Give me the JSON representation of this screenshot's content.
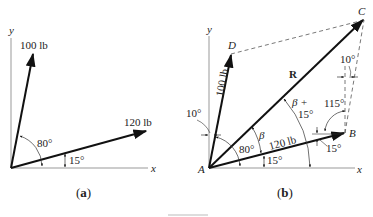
{
  "figure_a": {
    "caption": "(a)",
    "axis_x": "x",
    "axis_y": "y",
    "force_1_label": "100 lb",
    "force_2_label": "120 lb",
    "angle_force1": "80°",
    "angle_force2": "15°"
  },
  "figure_b": {
    "caption": "(b)",
    "axis_x": "x",
    "axis_y": "y",
    "point_A": "A",
    "point_B": "B",
    "point_C": "C",
    "point_D": "D",
    "resultant_label": "R",
    "force_1_label": "100 lb",
    "force_2_label": "120 lb",
    "angle_10_left": "10°",
    "angle_80": "80°",
    "angle_15_bottom": "15°",
    "angle_beta": "β",
    "angle_beta_plus_line1": "β +",
    "angle_beta_plus_line2": "15°",
    "angle_115": "115°",
    "angle_10_right": "10°",
    "angle_15_at_B": "15°"
  }
}
